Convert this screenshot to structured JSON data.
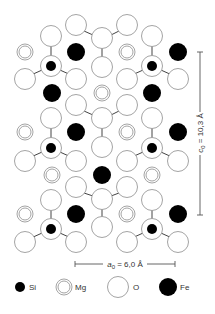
{
  "figure": {
    "type": "crystal-structure-projection",
    "mineral_atoms": [
      "Si",
      "Mg",
      "O",
      "Fe"
    ]
  },
  "scale_bars": {
    "a0": {
      "symbol": "a",
      "subscript": "0",
      "value_text": " = 6,0 Å",
      "orientation": "horizontal"
    },
    "c0": {
      "symbol": "c",
      "subscript": "0",
      "value_text": " = 10,3 Å",
      "orientation": "vertical"
    }
  },
  "legend": {
    "items": [
      {
        "symbol": "Si",
        "label": "Si",
        "style": "small-black-dot"
      },
      {
        "symbol": "Mg",
        "label": "Mg",
        "style": "double-ring"
      },
      {
        "symbol": "O",
        "label": "O",
        "style": "large-open-circle"
      },
      {
        "symbol": "Fe",
        "label": "Fe",
        "style": "large-black-circle"
      }
    ]
  },
  "colors": {
    "atom_outline": "#9a9a9a",
    "filled_atom": "#000000",
    "bond": "#444444",
    "text": "#333333"
  },
  "atoms": {
    "O": [
      [
        76,
        25
      ],
      [
        127,
        25
      ],
      [
        51,
        36
      ],
      [
        102,
        38
      ],
      [
        152,
        36
      ],
      [
        25,
        79
      ],
      [
        76,
        79
      ],
      [
        102,
        67
      ],
      [
        127,
        79
      ],
      [
        178,
        79
      ],
      [
        76,
        105
      ],
      [
        127,
        105
      ],
      [
        51,
        118
      ],
      [
        102,
        118
      ],
      [
        152,
        118
      ],
      [
        25,
        161
      ],
      [
        76,
        161
      ],
      [
        102,
        147
      ],
      [
        127,
        161
      ],
      [
        178,
        161
      ],
      [
        76,
        187
      ],
      [
        127,
        187
      ],
      [
        51,
        200
      ],
      [
        102,
        199
      ],
      [
        152,
        200
      ],
      [
        25,
        242
      ],
      [
        76,
        242
      ],
      [
        102,
        227
      ],
      [
        127,
        242
      ],
      [
        178,
        242
      ]
    ],
    "O_behind_Si": [
      [
        51,
        66
      ],
      [
        152,
        66
      ],
      [
        51,
        148
      ],
      [
        152,
        148
      ],
      [
        51,
        229
      ],
      [
        152,
        229
      ]
    ],
    "Si": [
      [
        51,
        66
      ],
      [
        152,
        66
      ],
      [
        51,
        148
      ],
      [
        152,
        148
      ],
      [
        51,
        229
      ],
      [
        152,
        229
      ]
    ],
    "Mg": [
      [
        25,
        52
      ],
      [
        127,
        52
      ],
      [
        102,
        93
      ],
      [
        25,
        132
      ],
      [
        127,
        132
      ],
      [
        52,
        175
      ],
      [
        152,
        175
      ],
      [
        25,
        214
      ],
      [
        127,
        214
      ]
    ],
    "Fe": [
      [
        76,
        52
      ],
      [
        178,
        52
      ],
      [
        52,
        93
      ],
      [
        152,
        93
      ],
      [
        76,
        132
      ],
      [
        178,
        132
      ],
      [
        102,
        175
      ],
      [
        76,
        214
      ],
      [
        178,
        214
      ]
    ]
  }
}
